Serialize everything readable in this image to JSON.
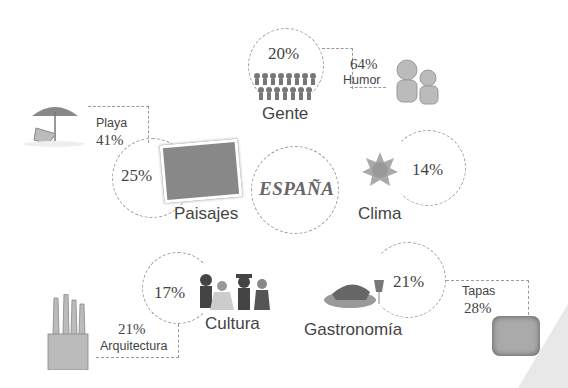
{
  "center": {
    "title": "ESPAÑA"
  },
  "categories": [
    {
      "key": "gente",
      "label": "Gente",
      "percent": "20%",
      "sub": {
        "label": "Humor",
        "percent": "64%"
      }
    },
    {
      "key": "paisajes",
      "label": "Paisajes",
      "percent": "25%",
      "sub": {
        "label": "Playa",
        "percent": "41%"
      }
    },
    {
      "key": "clima",
      "label": "Clima",
      "percent": "14%"
    },
    {
      "key": "cultura",
      "label": "Cultura",
      "percent": "17%",
      "sub": {
        "label": "Arquitectura",
        "percent": "21%"
      }
    },
    {
      "key": "gastronomia",
      "label": "Gastronomía",
      "percent": "21%",
      "sub": {
        "label": "Tapas",
        "percent": "28%"
      }
    }
  ],
  "colors": {
    "dashed_line": "#9a9a9a",
    "text": "#444444",
    "center_text": "#666666",
    "corner_shape": "#e8e8e8"
  }
}
